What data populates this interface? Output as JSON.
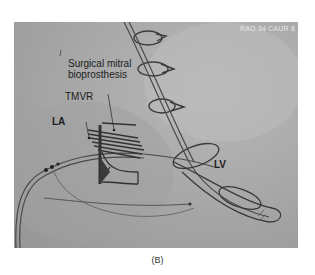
{
  "figure": {
    "panel_label": "(B)",
    "view_angle_text": "RAO 34 CAUR 8",
    "annotations": {
      "surgical_line1": "Surgical mitral",
      "surgical_line2": "bioprosthesis",
      "tmvr": "TMVR",
      "la": "LA",
      "lv": "LV"
    },
    "colors": {
      "background": "#a9a9a9",
      "device": "#3a3a3a",
      "text": "#1c1c1c"
    }
  }
}
